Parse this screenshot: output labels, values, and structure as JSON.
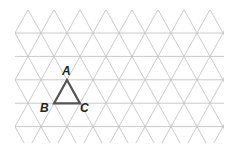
{
  "diagram": {
    "type": "isometric-triangular-grid",
    "grid": {
      "line_color": "#c4c4c4",
      "origin_x": 15,
      "spacing_x": 26,
      "row_height": 23.4,
      "first_row_y": 33,
      "rows": 5,
      "top_y": 10,
      "bottom_y": 143,
      "left_x": 15,
      "right_x": 224
    },
    "triangle": {
      "stroke_color": "#555555",
      "vertices": {
        "A": {
          "label": "A",
          "x": 67,
          "y": 80
        },
        "B": {
          "label": "B",
          "x": 54,
          "y": 103.4
        },
        "C": {
          "label": "C",
          "x": 80,
          "y": 103.4
        }
      }
    },
    "labels": {
      "A": "A",
      "B": "B",
      "C": "C"
    }
  }
}
